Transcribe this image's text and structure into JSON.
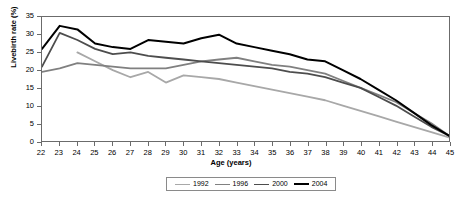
{
  "chart_data": {
    "type": "line",
    "title": "",
    "xlabel": "Age (years)",
    "ylabel": "Livebirth rate (%)",
    "x": [
      22,
      23,
      24,
      25,
      26,
      27,
      28,
      29,
      30,
      31,
      32,
      33,
      34,
      35,
      36,
      37,
      38,
      39,
      40,
      41,
      42,
      43,
      44,
      45
    ],
    "xlim": [
      22,
      45
    ],
    "ylim": [
      0,
      35
    ],
    "yticks": [
      0,
      5,
      10,
      15,
      20,
      25,
      30,
      35
    ],
    "xticks": [
      "22",
      "23",
      "24",
      "25",
      "26",
      "27",
      "28",
      "29",
      "30",
      "31",
      "32",
      "33",
      "34",
      "35",
      "36",
      "37",
      "38",
      "39",
      "40",
      "41",
      "42",
      "43",
      "44",
      "45"
    ],
    "grid": false,
    "legend_position": "bottom",
    "series": [
      {
        "name": "1992",
        "color": "#a8a8a8",
        "width": 1.8,
        "values": [
          null,
          null,
          25.0,
          22.5,
          20.0,
          18.0,
          19.5,
          16.5,
          18.5,
          18.0,
          17.5,
          16.5,
          15.5,
          14.5,
          13.5,
          12.5,
          11.5,
          10.0,
          8.5,
          7.0,
          5.5,
          4.0,
          2.5,
          1.0
        ]
      },
      {
        "name": "1996",
        "color": "#808080",
        "width": 1.8,
        "values": [
          19.5,
          20.5,
          22.0,
          21.5,
          21.0,
          20.5,
          20.5,
          20.5,
          21.5,
          22.5,
          23.0,
          23.5,
          22.5,
          21.5,
          21.0,
          20.0,
          19.0,
          17.0,
          15.0,
          13.0,
          11.0,
          8.0,
          5.0,
          1.5
        ]
      },
      {
        "name": "2000",
        "color": "#4d4d4d",
        "width": 1.8,
        "values": [
          21.0,
          30.5,
          28.5,
          26.0,
          24.5,
          25.0,
          24.0,
          23.5,
          23.0,
          22.5,
          22.0,
          21.5,
          21.0,
          20.5,
          19.5,
          19.0,
          18.0,
          16.5,
          15.0,
          12.5,
          10.0,
          7.0,
          4.0,
          1.5
        ]
      },
      {
        "name": "2004",
        "color": "#000000",
        "width": 2.0,
        "values": [
          26.0,
          32.5,
          31.5,
          27.5,
          26.5,
          26.0,
          28.5,
          28.0,
          27.5,
          29.0,
          30.0,
          27.5,
          26.5,
          25.5,
          24.5,
          23.0,
          22.5,
          20.0,
          17.5,
          14.5,
          11.5,
          8.0,
          4.5,
          1.5
        ]
      }
    ]
  },
  "legend": {
    "items": [
      {
        "label": "1992"
      },
      {
        "label": "1996"
      },
      {
        "label": "2000"
      },
      {
        "label": "2004"
      }
    ]
  },
  "axes": {
    "y_title": "Livebirth rate (%)",
    "x_title": "Age (years)"
  }
}
